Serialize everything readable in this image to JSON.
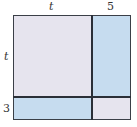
{
  "diagram": {
    "type": "area-model",
    "labels": {
      "top_left": "t",
      "top_right": "5",
      "left_top": "t",
      "left_bottom": "3"
    },
    "regions": [
      {
        "name": "t-by-t",
        "color": "#e6e4ee"
      },
      {
        "name": "t-by-5",
        "color": "#c6dcef"
      },
      {
        "name": "3-by-t",
        "color": "#c6dcef"
      },
      {
        "name": "3-by-5",
        "color": "#e6e4ee"
      }
    ],
    "colors": {
      "gray_region": "#e6e4ee",
      "blue_region": "#c6dcef",
      "border": "#2a2f37"
    }
  }
}
